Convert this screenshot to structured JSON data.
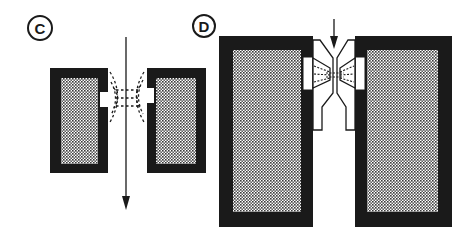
{
  "panels": [
    {
      "id": "C",
      "label": "C",
      "description": "Magnet pole pieces with fringing field lines around gap, arrow passing through gap"
    },
    {
      "id": "D",
      "label": "D",
      "description": "Magnet pole pieces with shaped pole tips concentrating field in narrow gap, arrow entering from top"
    }
  ],
  "colors": {
    "magnet_body": "#1a1a1a",
    "fill_pattern": "#555555",
    "background": "#ffffff"
  }
}
